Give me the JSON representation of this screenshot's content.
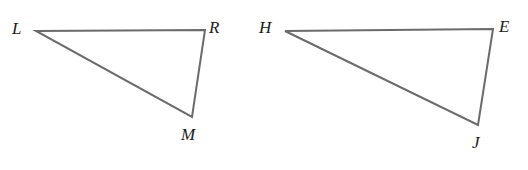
{
  "figure": {
    "type": "geometry-diagram",
    "background_color": "#ffffff",
    "stroke_color": "#6b6b6b",
    "stroke_width": 2,
    "label_color": "#1a1a1a",
    "label_font_size": 17,
    "label_style": "italic-serif",
    "canvas": {
      "width": 528,
      "height": 170
    }
  },
  "shapes": [
    {
      "name": "triangle-lrm",
      "label": "Triangle LRM",
      "points": "36,31 205,30 192,117",
      "vertices": [
        {
          "id": "L",
          "label": "L",
          "x": 36,
          "y": 31,
          "label_x": 12,
          "label_y": 20
        },
        {
          "id": "R",
          "label": "R",
          "x": 205,
          "y": 30,
          "label_x": 209,
          "label_y": 19
        },
        {
          "id": "M",
          "label": "M",
          "x": 192,
          "y": 117,
          "label_x": 181,
          "label_y": 126
        }
      ]
    },
    {
      "name": "triangle-hej",
      "label": "Triangle HEJ",
      "points": "285,31 493,29 478,125",
      "vertices": [
        {
          "id": "H",
          "label": "H",
          "x": 285,
          "y": 31,
          "label_x": 259,
          "label_y": 19
        },
        {
          "id": "E",
          "label": "E",
          "x": 493,
          "y": 29,
          "label_x": 499,
          "label_y": 18
        },
        {
          "id": "J",
          "label": "J",
          "x": 478,
          "y": 125,
          "label_x": 472,
          "label_y": 134
        }
      ]
    }
  ]
}
